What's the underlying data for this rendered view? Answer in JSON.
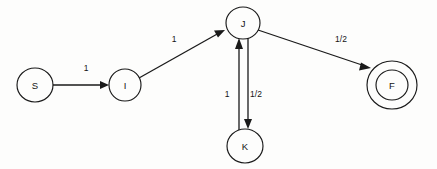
{
  "diagram": {
    "type": "state-machine",
    "background_color": "#fdfdfc",
    "stroke_color": "#1a1a1a",
    "nodes": [
      {
        "id": "S",
        "label": "S",
        "kind": "start",
        "cx": 35,
        "cy": 85,
        "r": 17,
        "accepting": false
      },
      {
        "id": "I",
        "label": "I",
        "kind": "normal",
        "cx": 125,
        "cy": 85,
        "r": 16,
        "accepting": false
      },
      {
        "id": "J",
        "label": "J",
        "kind": "normal",
        "cx": 243,
        "cy": 23,
        "r": 16,
        "accepting": false
      },
      {
        "id": "K",
        "label": "K",
        "kind": "normal",
        "cx": 245,
        "cy": 146,
        "r": 17,
        "accepting": false
      },
      {
        "id": "F",
        "label": "F",
        "kind": "accept",
        "cx": 392,
        "cy": 85,
        "r": 15,
        "r_outer": 24,
        "accepting": true
      }
    ],
    "edges": [
      {
        "id": "S-I",
        "from": "S",
        "to": "I",
        "label": "1",
        "label_x": 86,
        "label_y": 68
      },
      {
        "id": "I-J",
        "from": "I",
        "to": "J",
        "label": "1",
        "label_x": 174,
        "label_y": 39
      },
      {
        "id": "J-F",
        "from": "J",
        "to": "F",
        "label": "1/2",
        "label_x": 341,
        "label_y": 39
      },
      {
        "id": "J-K",
        "from": "J",
        "to": "K",
        "label": "1/2",
        "label_x": 256,
        "label_y": 94
      },
      {
        "id": "K-J",
        "from": "K",
        "to": "J",
        "label": "1",
        "label_x": 227,
        "label_y": 94
      }
    ]
  }
}
